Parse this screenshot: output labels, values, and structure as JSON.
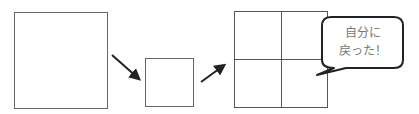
{
  "diagram": {
    "shapes": [
      {
        "id": "large-square",
        "label": ""
      },
      {
        "id": "small-square",
        "label": ""
      },
      {
        "id": "grid-square-2x2",
        "label": ""
      }
    ],
    "arrows": [
      {
        "from": "large-square",
        "to": "small-square",
        "direction": "down-right"
      },
      {
        "from": "small-square",
        "to": "grid-square-2x2",
        "direction": "up-right"
      }
    ],
    "speech_bubble": {
      "line1": "自分に",
      "line2": "戻った！"
    },
    "colors": {
      "stroke": "#555555",
      "arrow": "#222222",
      "bubble_border": "#222222",
      "bubble_text": "#777777"
    }
  }
}
